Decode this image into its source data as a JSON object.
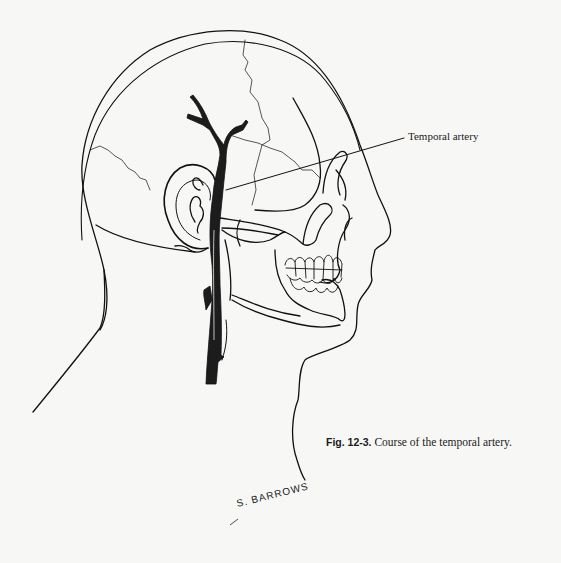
{
  "figure": {
    "labels": [
      {
        "id": "temporal-artery",
        "text": "Temporal artery"
      }
    ],
    "caption": {
      "number": "Fig. 12-3.",
      "text": " Course of the temporal artery."
    },
    "signature": "S. BARROWS",
    "colors": {
      "background": "#f7f7f5",
      "line": "#111111",
      "artery": "#1c1c1c"
    }
  }
}
